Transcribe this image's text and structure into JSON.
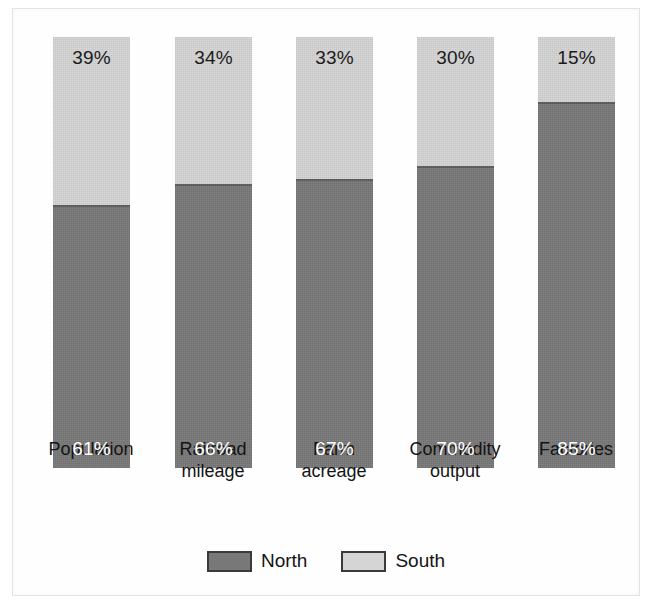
{
  "figure": {
    "background_color": "#ffffff",
    "frame_color": "#e3e3e3"
  },
  "chart_data": {
    "type": "bar",
    "subtype": "100% stacked vertical bar",
    "title": "",
    "subtitle": "",
    "xlabel": "",
    "ylabel": "",
    "ylim": [
      0,
      100
    ],
    "grid": false,
    "legend_position": "bottom-center",
    "categories": [
      "Population",
      "Railroad mileage",
      "Farm acreage",
      "Commodity output",
      "Factories"
    ],
    "series": [
      {
        "name": "North",
        "color": "#787878",
        "values": [
          61,
          66,
          67,
          70,
          85
        ],
        "labels": [
          "61%",
          "66%",
          "67%",
          "70%",
          "85%"
        ],
        "label_color": "#ffffff"
      },
      {
        "name": "South",
        "color": "#d5d5d5",
        "values": [
          39,
          34,
          33,
          30,
          15
        ],
        "labels": [
          "39%",
          "34%",
          "33%",
          "30%",
          "15%"
        ],
        "label_color": "#1a1a1a"
      }
    ]
  },
  "bars": [
    {
      "category_label": "Population",
      "category_line1": "Population",
      "category_line2": "",
      "south_label": "39%",
      "north_label": "61%",
      "south_pct": 39,
      "north_pct": 61
    },
    {
      "category_label": "Railroad mileage",
      "category_line1": "Railroad",
      "category_line2": "mileage",
      "south_label": "34%",
      "north_label": "66%",
      "south_pct": 34,
      "north_pct": 66
    },
    {
      "category_label": "Farm acreage",
      "category_line1": "Farm",
      "category_line2": "acreage",
      "south_label": "33%",
      "north_label": "67%",
      "south_pct": 33,
      "north_pct": 67
    },
    {
      "category_label": "Commodity output",
      "category_line1": "Commodity",
      "category_line2": "output",
      "south_label": "30%",
      "north_label": "70%",
      "south_pct": 30,
      "north_pct": 70
    },
    {
      "category_label": "Factories",
      "category_line1": "Factories",
      "category_line2": "",
      "south_label": "15%",
      "north_label": "85%",
      "south_pct": 15,
      "north_pct": 85
    }
  ],
  "legend": {
    "items": [
      {
        "label": "North",
        "color": "#787878"
      },
      {
        "label": "South",
        "color": "#d5d5d5"
      }
    ]
  }
}
